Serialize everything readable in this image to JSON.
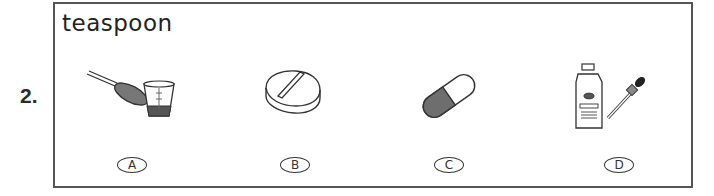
{
  "question": {
    "number": "2.",
    "word": "teaspoon",
    "options": [
      {
        "letter": "A",
        "picture": "measuring-spoon-and-cup-icon"
      },
      {
        "letter": "B",
        "picture": "tablet-pill-icon"
      },
      {
        "letter": "C",
        "picture": "capsule-icon"
      },
      {
        "letter": "D",
        "picture": "eye-drops-bottle-and-dropper-icon"
      }
    ]
  }
}
